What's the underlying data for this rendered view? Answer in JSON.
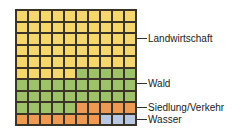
{
  "chart_data": {
    "type": "waffle",
    "title": "",
    "grid": {
      "rows": 10,
      "cols": 10,
      "fill_order": "row-major from top-left"
    },
    "categories": [
      "Landwirtschaft",
      "Wald",
      "Siedlung/Verkehr",
      "Wasser"
    ],
    "values": [
      55,
      30,
      12,
      3
    ],
    "unit": "cells of 100",
    "colors": [
      "#f5d76e",
      "#9dc26a",
      "#ef9a52",
      "#b9c8e2"
    ],
    "legend_position": "right, leader lines"
  },
  "labels": [
    {
      "text": "Landwirtschaft",
      "y": 32
    },
    {
      "text": "Wald",
      "y": 77
    },
    {
      "text": "Siedlung/Verkehr",
      "y": 101
    },
    {
      "text": "Wasser",
      "y": 113
    }
  ]
}
